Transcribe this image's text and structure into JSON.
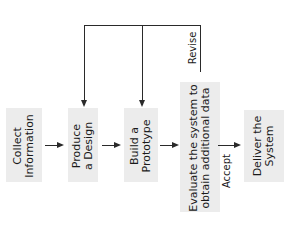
{
  "diagram": {
    "type": "flowchart",
    "orientation": "rotated-90-ccw",
    "nodes": [
      {
        "id": "collect",
        "line1": "Collect",
        "line2": "Information"
      },
      {
        "id": "design",
        "line1": "Produce",
        "line2": "a Design"
      },
      {
        "id": "prototype",
        "line1": "Build a",
        "line2": "Prototype"
      },
      {
        "id": "evaluate",
        "line1": "Evaluate the system to",
        "line2": "obtain additional data"
      },
      {
        "id": "deliver",
        "line1": "Deliver the",
        "line2": "System"
      }
    ],
    "edges": [
      {
        "from": "collect",
        "to": "design",
        "label": ""
      },
      {
        "from": "design",
        "to": "prototype",
        "label": ""
      },
      {
        "from": "prototype",
        "to": "evaluate",
        "label": ""
      },
      {
        "from": "evaluate",
        "to": "deliver",
        "label": "Accept"
      },
      {
        "from": "evaluate",
        "to": "design",
        "label": "Revise"
      },
      {
        "from": "evaluate",
        "to": "prototype",
        "label": "Revise"
      }
    ],
    "labels": {
      "revise": "Revise",
      "accept": "Accept"
    }
  }
}
